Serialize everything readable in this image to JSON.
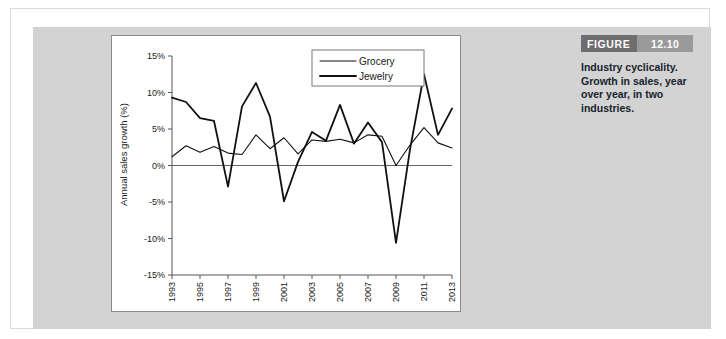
{
  "figure": {
    "badge_word": "FIGURE",
    "badge_number": "12.10",
    "caption": "Industry cyclicality. Growth in sales, year over year, in two industries.",
    "badge_word_color": "#6e6e6e",
    "badge_number_color": "#9a9a9a",
    "caption_color": "#16232e"
  },
  "panel": {
    "background_color": "#d3d3d3",
    "card_background_color": "#ffffff",
    "card_border_color": "#8a8a8a"
  },
  "chart_data": {
    "type": "line",
    "title": "",
    "xlabel": "",
    "ylabel": "Annual sales growth (%)",
    "xlim": [
      1993,
      2013
    ],
    "ylim": [
      -15,
      15
    ],
    "ytick_values": [
      15,
      10,
      5,
      0,
      -5,
      -10,
      -15
    ],
    "ytick_labels": [
      "15%",
      "10%",
      "5%",
      "0%",
      "-5%",
      "-10%",
      "-15%"
    ],
    "xtick_values": [
      1993,
      1995,
      1997,
      1999,
      2001,
      2003,
      2005,
      2007,
      2009,
      2011,
      2013
    ],
    "xtick_labels": [
      "1993",
      "1995",
      "1997",
      "1999",
      "2001",
      "2003",
      "2005",
      "2007",
      "2009",
      "2011",
      "2013"
    ],
    "grid": false,
    "legend_position": "top-right",
    "zero_line": 0,
    "x": [
      1993,
      1994,
      1995,
      1996,
      1997,
      1998,
      1999,
      2000,
      2001,
      2002,
      2003,
      2004,
      2005,
      2006,
      2007,
      2008,
      2009,
      2010,
      2011,
      2012,
      2013
    ],
    "series": [
      {
        "name": "Grocery",
        "stroke_width": 1.1,
        "color": "#111111",
        "values": [
          1.2,
          2.7,
          1.8,
          2.6,
          1.7,
          1.5,
          4.2,
          2.3,
          3.8,
          1.6,
          3.5,
          3.3,
          3.6,
          3.1,
          4.2,
          4.0,
          0.0,
          2.8,
          5.2,
          3.1,
          2.4
        ]
      },
      {
        "name": "Jewelry",
        "stroke_width": 1.8,
        "color": "#111111",
        "values": [
          9.3,
          8.7,
          6.5,
          6.1,
          -2.9,
          8.1,
          11.3,
          6.7,
          -4.9,
          0.5,
          4.6,
          3.4,
          8.3,
          3.0,
          5.9,
          3.2,
          -10.6,
          2.2,
          12.5,
          4.2,
          7.8
        ]
      }
    ]
  }
}
